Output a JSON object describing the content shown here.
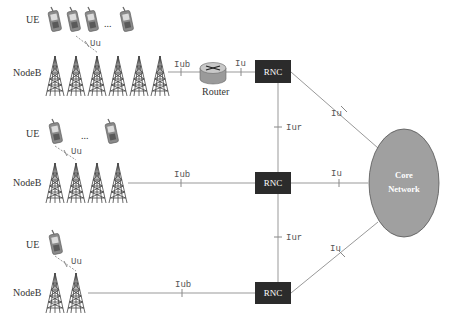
{
  "labels": {
    "ue": "UE",
    "nodeb": "NodeB",
    "router": "Router",
    "rnc": "RNC",
    "ellipsis": "...",
    "core_line1": "Core",
    "core_line2": "Network"
  },
  "interfaces": {
    "uu": "Uu",
    "iub": "Iub",
    "iu": "Iu",
    "iur": "Iur"
  },
  "rows": [
    {
      "name": "row-1",
      "ue_count_shown": 4,
      "nodeb_count": 6,
      "has_router": true
    },
    {
      "name": "row-2",
      "ue_count_shown": 2,
      "nodeb_count": 4,
      "has_router": false
    },
    {
      "name": "row-3",
      "ue_count_shown": 1,
      "nodeb_count": 2,
      "has_router": false
    }
  ],
  "colors": {
    "rnc_fill": "#2b2b2b",
    "core_fill": "#a0a0a0",
    "core_stroke": "#555555",
    "line": "#999999",
    "tower": "#444444"
  }
}
